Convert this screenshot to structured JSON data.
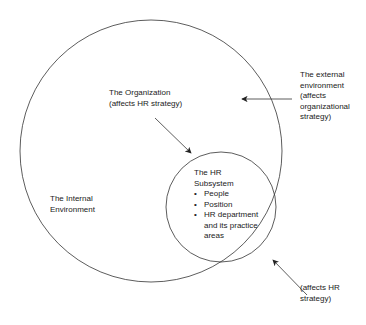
{
  "diagram": {
    "outer_circle": {
      "label_line1": "The Internal",
      "label_line2": "Environment"
    },
    "organization": {
      "line1": "The Organization",
      "line2": "(affects HR strategy)"
    },
    "external": {
      "lines": [
        "The external",
        "environment",
        "(affects",
        "organizational",
        "strategy)"
      ]
    },
    "hr_subsystem": {
      "title_line1": "The HR",
      "title_line2": "Subsystem",
      "items": [
        "People",
        "Position",
        "HR department",
        "and its practice",
        "areas"
      ]
    },
    "hr_strategy": {
      "line1": "(affects HR",
      "line2": "strategy)"
    },
    "colors": {
      "stroke": "#333333"
    }
  }
}
